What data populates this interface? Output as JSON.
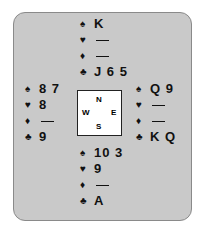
{
  "north": {
    "spades": "K",
    "hearts": "—",
    "diamonds": "—",
    "clubs": "J 6 5"
  },
  "west": {
    "spades": "8 7",
    "hearts": "8",
    "diamonds": "—",
    "clubs": "9"
  },
  "east": {
    "spades": "Q 9",
    "hearts": "—",
    "diamonds": "—",
    "clubs": "K Q"
  },
  "south": {
    "spades": "10 3",
    "hearts": "9",
    "diamonds": "—",
    "clubs": "A"
  },
  "compass": {
    "n": "N",
    "s": "S",
    "e": "E",
    "w": "W"
  },
  "suits": {
    "spades": "♠",
    "hearts": "♥",
    "diamonds": "♦",
    "clubs": "♣"
  }
}
